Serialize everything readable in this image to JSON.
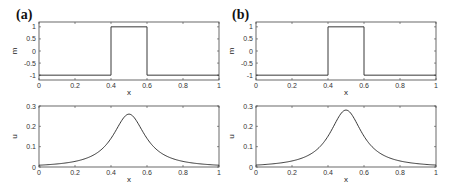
{
  "chart_data": [
    {
      "panel": "(a)",
      "type": "line",
      "subplots": [
        {
          "title": "",
          "xlabel": "x",
          "ylabel": "m",
          "xlim": [
            0,
            1
          ],
          "ylim": [
            -1.2,
            1.2
          ],
          "xticks": [
            "0",
            "0.2",
            "0.4",
            "0.6",
            "0.8",
            "1"
          ],
          "yticks": [
            "-1",
            "-0.5",
            "0",
            "0.5",
            "1"
          ],
          "grid": false,
          "series": [
            {
              "name": "m",
              "shape": "step",
              "x": [
                0,
                0.4,
                0.4,
                0.6,
                0.6,
                1
              ],
              "y": [
                -1,
                -1,
                1,
                1,
                -1,
                -1
              ]
            }
          ]
        },
        {
          "title": "",
          "xlabel": "x",
          "ylabel": "u",
          "xlim": [
            0,
            1
          ],
          "ylim": [
            0,
            0.3
          ],
          "xticks": [
            "0",
            "0.2",
            "0.4",
            "0.6",
            "0.8",
            "1"
          ],
          "yticks": [
            "0",
            "0.1",
            "0.2",
            "0.3"
          ],
          "grid": false,
          "series": [
            {
              "name": "u",
              "shape": "bell",
              "peak_x": 0.5,
              "peak_y": 0.26,
              "x": [
                0,
                0.1,
                0.2,
                0.3,
                0.4,
                0.45,
                0.5,
                0.55,
                0.6,
                0.7,
                0.8,
                0.9,
                1
              ],
              "y": [
                0.003,
                0.01,
                0.025,
                0.06,
                0.15,
                0.22,
                0.26,
                0.22,
                0.15,
                0.06,
                0.025,
                0.01,
                0.003
              ]
            }
          ]
        }
      ]
    },
    {
      "panel": "(b)",
      "type": "line",
      "subplots": [
        {
          "title": "",
          "xlabel": "x",
          "ylabel": "m",
          "xlim": [
            0,
            1
          ],
          "ylim": [
            -1.2,
            1.2
          ],
          "xticks": [
            "0",
            "0.2",
            "0.4",
            "0.6",
            "0.8",
            "1"
          ],
          "yticks": [
            "-1",
            "-0.5",
            "0",
            "0.5",
            "1"
          ],
          "grid": false,
          "series": [
            {
              "name": "m",
              "shape": "step",
              "x": [
                0,
                0.4,
                0.4,
                0.6,
                0.6,
                1
              ],
              "y": [
                -1,
                -1,
                1,
                1,
                -1,
                -1
              ]
            }
          ]
        },
        {
          "title": "",
          "xlabel": "x",
          "ylabel": "u",
          "xlim": [
            0,
            1
          ],
          "ylim": [
            0,
            0.3
          ],
          "xticks": [
            "0",
            "0.2",
            "0.4",
            "0.6",
            "0.8",
            "1"
          ],
          "yticks": [
            "0",
            "0.1",
            "0.2",
            "0.3"
          ],
          "grid": false,
          "series": [
            {
              "name": "u",
              "shape": "bell",
              "peak_x": 0.5,
              "peak_y": 0.28,
              "x": [
                0,
                0.1,
                0.2,
                0.3,
                0.4,
                0.45,
                0.5,
                0.55,
                0.6,
                0.7,
                0.8,
                0.9,
                1
              ],
              "y": [
                0.002,
                0.008,
                0.022,
                0.06,
                0.16,
                0.235,
                0.28,
                0.235,
                0.16,
                0.06,
                0.022,
                0.008,
                0.002
              ]
            }
          ]
        }
      ]
    }
  ],
  "panels": [
    {
      "label": "(a)"
    },
    {
      "label": "(b)"
    }
  ]
}
